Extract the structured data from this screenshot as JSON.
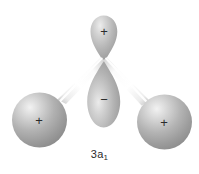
{
  "figure": {
    "caption_main": "3a",
    "caption_sub": "1",
    "caption_full": "3a1",
    "background_color": "#ffffff",
    "ink_color": "#2b2b2b"
  },
  "orbitals": {
    "central_top_lobe": {
      "name": "central-top-lobe",
      "sign": "+",
      "shape": "teardrop-pointing-down",
      "fill_color": "#a8a8a8",
      "highlight_color": "#e8e8e8"
    },
    "central_bottom_lobe": {
      "name": "central-bottom-lobe",
      "sign": "−",
      "shape": "teardrop-pointing-up",
      "fill_color": "#a0a0a0",
      "highlight_color": "#e0e0e0"
    },
    "left_sphere": {
      "name": "left-hydrogen-sphere",
      "sign": "+",
      "shape": "sphere",
      "fill_color": "#9a9a9a",
      "highlight_color": "#dcdcdc"
    },
    "right_sphere": {
      "name": "right-hydrogen-sphere",
      "sign": "+",
      "shape": "sphere",
      "fill_color": "#9a9a9a",
      "highlight_color": "#dcdcdc"
    }
  },
  "bonds": {
    "left_bond": {
      "name": "left-bond-cylinder",
      "color": "#ffffff",
      "edge_color": "#c4c4c4"
    },
    "right_bond": {
      "name": "right-bond-cylinder",
      "color": "#ffffff",
      "edge_color": "#c4c4c4"
    }
  }
}
